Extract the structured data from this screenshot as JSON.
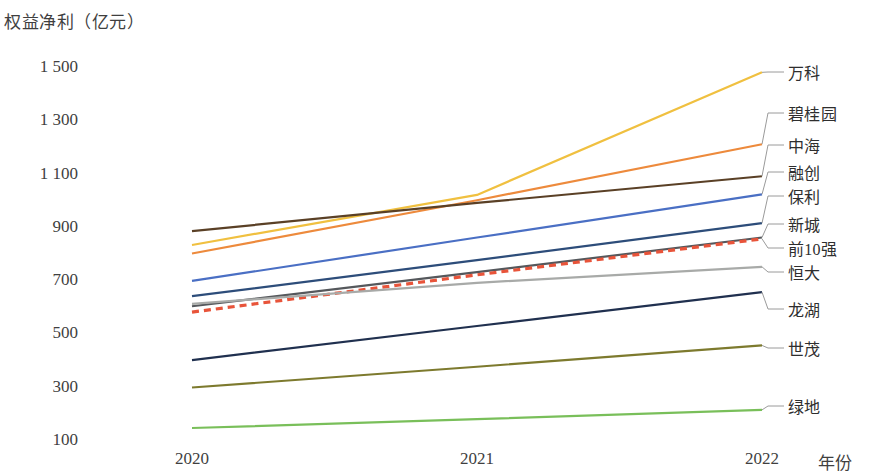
{
  "chart_data": {
    "type": "line",
    "title": "权益净利（亿元）",
    "ylabel": "权益净利（亿元）",
    "xlabel": "年份",
    "categories": [
      "2020",
      "2021",
      "2022"
    ],
    "x_tick_labels": [
      "2020",
      "2021",
      "2022"
    ],
    "y_tick_labels": [
      "1 500",
      "1 300",
      "1 100",
      "900",
      "700",
      "500",
      "300",
      "100"
    ],
    "y_ticks": [
      1500,
      1300,
      1100,
      900,
      700,
      500,
      300,
      100
    ],
    "ylim": [
      100,
      1500
    ],
    "grid": false,
    "legend_position": "right-inline-labels",
    "series": [
      {
        "name": "万科",
        "values": [
          832,
          1020,
          1480
        ],
        "color": "#f0c040",
        "style": "solid"
      },
      {
        "name": "碧桂园",
        "values": [
          800,
          1000,
          1210
        ],
        "color": "#ed8a3c",
        "style": "solid"
      },
      {
        "name": "中海",
        "values": [
          884,
          990,
          1090
        ],
        "color": "#5a4026",
        "style": "solid"
      },
      {
        "name": "融创",
        "values": [
          697,
          860,
          1022
        ],
        "color": "#4a6fc4",
        "style": "solid"
      },
      {
        "name": "保利",
        "values": [
          640,
          775,
          914
        ],
        "color": "#2d4d7a",
        "style": "solid"
      },
      {
        "name": "新城",
        "values": [
          602,
          730,
          860
        ],
        "color": "#55585c",
        "style": "solid"
      },
      {
        "name": "前10强",
        "values": [
          580,
          720,
          855
        ],
        "color": "#e8543a",
        "style": "dashed"
      },
      {
        "name": "恒大",
        "values": [
          611,
          690,
          750
        ],
        "color": "#a8aaa8",
        "style": "solid"
      },
      {
        "name": "龙湖",
        "values": [
          400,
          528,
          655
        ],
        "color": "#20304f",
        "style": "solid"
      },
      {
        "name": "世茂",
        "values": [
          297,
          375,
          455
        ],
        "color": "#7d7a2e",
        "style": "solid"
      },
      {
        "name": "绿地",
        "values": [
          145,
          178,
          213
        ],
        "color": "#79bf5a",
        "style": "solid"
      }
    ]
  },
  "labels": {
    "wanke": "万科",
    "biguiyuan": "碧桂园",
    "zhonghai": "中海",
    "rongchuang": "融创",
    "baoli": "保利",
    "xincheng": "新城",
    "qian10qiang": "前10强",
    "hengda": "恒大",
    "longhu": "龙湖",
    "shimao": "世茂",
    "lvdi": "绿地"
  }
}
